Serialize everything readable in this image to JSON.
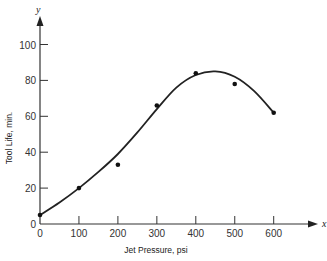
{
  "chart_data": {
    "type": "scatter",
    "title": "",
    "xlabel": "Jet Pressure, psi",
    "ylabel": "Tool Life, min.",
    "x_axis_name": "x",
    "y_axis_name": "y",
    "xlim": [
      0,
      650
    ],
    "ylim": [
      0,
      110
    ],
    "x_ticks": [
      0,
      100,
      200,
      300,
      400,
      500,
      600
    ],
    "y_ticks": [
      0,
      20,
      40,
      60,
      80,
      100
    ],
    "grid": false,
    "legend": null,
    "series": [
      {
        "name": "Measured points",
        "type": "scatter",
        "x": [
          0,
          100,
          200,
          300,
          400,
          500,
          600
        ],
        "y": [
          5,
          20,
          33,
          66,
          84,
          78,
          62
        ]
      },
      {
        "name": "Fitted curve",
        "type": "line",
        "x": [
          0,
          50,
          100,
          150,
          200,
          250,
          300,
          350,
          400,
          450,
          500,
          550,
          600
        ],
        "y": [
          5,
          12,
          20,
          29,
          39,
          51,
          64,
          76,
          83,
          85,
          82,
          74,
          62
        ]
      }
    ]
  }
}
